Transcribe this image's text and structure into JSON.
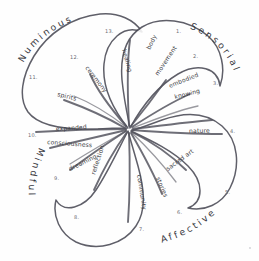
{
  "diagram": {
    "stroke_color": "#4a4a55",
    "text_color": "#3b3b42",
    "background": "#ffffff",
    "center_label": ""
  },
  "quadrants": [
    {
      "id": "numinous",
      "label": "Numinous",
      "position": "top-left"
    },
    {
      "id": "sensorial",
      "label": "Sensorial",
      "position": "top-right"
    },
    {
      "id": "affective",
      "label": "Affective",
      "position": "bottom-right"
    },
    {
      "id": "mindful",
      "label": "Mindful",
      "position": "bottom-left"
    }
  ],
  "petals": [
    {
      "number": "1.",
      "label": "body",
      "label_line1": "body",
      "label_line2": "",
      "quadrant": "sensorial"
    },
    {
      "number": "2.",
      "label": "movement",
      "label_line1": "movement",
      "label_line2": "",
      "quadrant": "sensorial"
    },
    {
      "number": "3.",
      "label": "embodied knowing",
      "label_line1": "embodied",
      "label_line2": "knowing",
      "quadrant": "sensorial"
    },
    {
      "number": "4.",
      "label": "nature",
      "label_line1": "nature",
      "label_line2": "",
      "quadrant": "sensorial"
    },
    {
      "number": "5.",
      "label": "sacred art",
      "label_line1": "sacred art",
      "label_line2": "",
      "quadrant": "affective"
    },
    {
      "number": "6.",
      "label": "stories",
      "label_line1": "stories",
      "label_line2": "",
      "quadrant": "affective"
    },
    {
      "number": "7.",
      "label": "community",
      "label_line1": "community",
      "label_line2": "",
      "quadrant": "affective"
    },
    {
      "number": "8.",
      "label": "reflection",
      "label_line1": "reflection",
      "label_line2": "",
      "quadrant": "mindful"
    },
    {
      "number": "9.",
      "label": "dreaming",
      "label_line1": "dreaming",
      "label_line2": "",
      "quadrant": "mindful"
    },
    {
      "number": "10.",
      "label": "expanded consciousness",
      "label_line1": "expanded",
      "label_line2": "consciousness",
      "quadrant": "mindful"
    },
    {
      "number": "11.",
      "label": "spirits",
      "label_line1": "spirits",
      "label_line2": "",
      "quadrant": "numinous"
    },
    {
      "number": "12.",
      "label": "ceremony",
      "label_line1": "ceremony",
      "label_line2": "",
      "quadrant": "numinous"
    },
    {
      "number": "13.",
      "label": "healing",
      "label_line1": "healing",
      "label_line2": "",
      "quadrant": "numinous"
    }
  ]
}
